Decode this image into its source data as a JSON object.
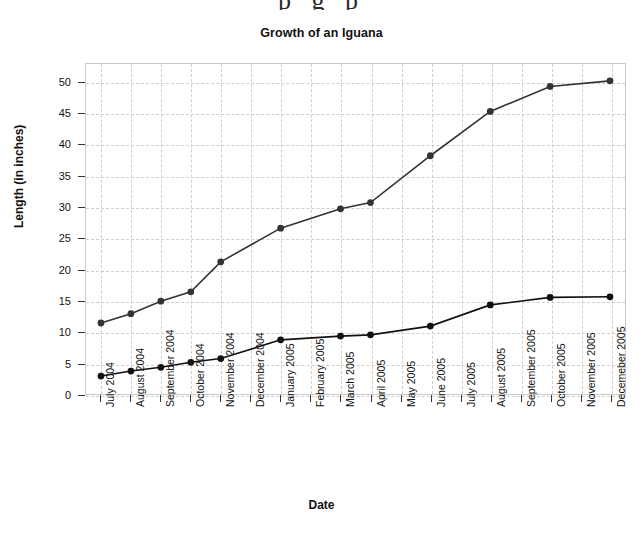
{
  "page_bleed_text": "p g p",
  "chart_data": {
    "type": "line",
    "title": "Growth of an Iguana",
    "xlabel": "Date",
    "ylabel": "Length (in inches)",
    "grid": true,
    "legend": "none",
    "xlim": [
      0,
      17
    ],
    "ylim": [
      0,
      53
    ],
    "yticks": [
      0,
      5,
      10,
      15,
      20,
      25,
      30,
      35,
      40,
      45,
      50
    ],
    "ytick_labels": [
      "0",
      "5",
      "10",
      "15",
      "20",
      "25",
      "30",
      "35",
      "40",
      "45",
      "50"
    ],
    "categories": [
      "July 2004",
      "August 2004",
      "September 2004",
      "October 2004",
      "November 2004",
      "December 2004",
      "January 2005",
      "February 2005",
      "March 2005",
      "April 2005",
      "May 2005",
      "June 2005",
      "July 2005",
      "August 2005",
      "September 2005",
      "October 2005",
      "November 2005",
      "Decemeber 2005"
    ],
    "marker_indices": [
      0,
      1,
      2,
      3,
      4,
      6,
      8,
      9,
      11,
      13,
      15,
      17
    ],
    "series": [
      {
        "name": "upper-curve",
        "color": "#333333",
        "values": [
          11.5,
          13.0,
          15.0,
          16.5,
          21.3,
          null,
          26.7,
          null,
          29.8,
          30.8,
          null,
          38.3,
          null,
          45.4,
          null,
          49.4,
          null,
          50.3
        ]
      },
      {
        "name": "lower-curve",
        "color": "#111111",
        "values": [
          3.0,
          3.8,
          4.4,
          5.2,
          5.8,
          null,
          8.8,
          null,
          9.4,
          9.6,
          null,
          11.0,
          null,
          14.4,
          null,
          15.6,
          null,
          15.7
        ]
      }
    ]
  }
}
